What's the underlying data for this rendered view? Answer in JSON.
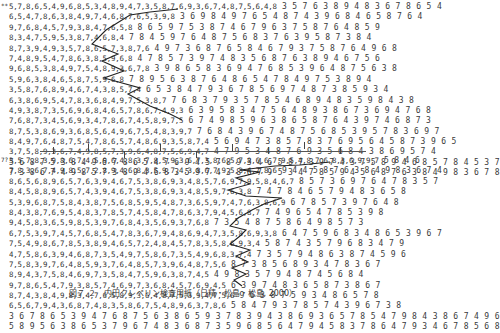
{
  "document": {
    "title": "Uchida-Kraepelin test sheet example",
    "caption": "図７.２　内田クレペリン検査用紙（日精・松島・松島, 2000）"
  },
  "sheet_top": {
    "marker": "**",
    "rows": [
      {
        "done": "5,7,8,6,5,4,9,6,8,5,3,4,8,9,4,7,3,5,8,7,6,9,3,6,7,4,8,7,5,6,4,8",
        "rest": "3 5 7 6 3 8 9 4 8 3 6 7 8 6 5 4"
      },
      {
        "done": "6,5,4,7,8,6,3,8,4,9,7,4,6,8,7,6,5,3,9,8",
        "rest": "3 6 9 8 4 9 7 6 5 4 8 7 4 3 9 6 8 4 6 5 8 7 6 4"
      },
      {
        "done": "9,7,6,8,4,5,7,9,3,8,4,7,6,5,8",
        "rest": "8 6 5 9 7 5 3 8 7 4 6 7 9 6 3 7 5 8 7 6 4 8 5 9"
      },
      {
        "done": "8,3,4,7,5,9,5,3,8,7,4,6,8,4",
        "rest": "7 8 4 5 9 7 6 4 8 7 5 6 8 3 7 6 3 9 5 8 7 3 8 4"
      },
      {
        "done": "8,7,3,9,4,9,3,5,7,8,6,5,7,3,8,7,6",
        "rest": "4 9 7 3 6 8 7 6 5 8 4 6 7 9 3 7 5 8 7 6 4 9 6 8"
      },
      {
        "done": "7,4,8,9,5,4,7,8,6,3,8,5,9,6,8",
        "rest": "4 7 8 5 7 3 9 7 4 8 3 5 6 8 7 6 3 8 9 4 6 7 5 6"
      },
      {
        "done": "9,6,8,5,3,8,4,9,7,5,4,8,9,3,6,7,8",
        "rest": "3 9 8 6 5 8 3 6 9 4 7 6 8 5 3 9 6 4 8 7 5 6 3 8"
      },
      {
        "done": "5,9,6,3,8,4,6,5,8,7,5,9,6,8",
        "rest": "7 8 9 5 6 3 8 7 6 4 8 6 5 4 7 8 4 9 7 5 3 8 9 4"
      },
      {
        "done": "3,5,8,7,6,8,9,4,6,7,4,3,8,5,7,4",
        "rest": "6 5 3 8 4 7 9 3 6 7 8 5 6 9 7 4 8 7 3 8 5 9 3 4"
      },
      {
        "done": "6,3,8,6,9,5,4,7,8,3,6,8,4,9,7,5,3,8,7",
        "rest": "7 6 8 3 7 9 3 5 7 8 5 4 6 8 9 4 8 3 5 9 8 4 3 8"
      },
      {
        "done": "4,9,3,8,7,3,5,6,9,6,8,4,6,5,7,8,6,7,4,9,3",
        "rest": "6 3 9 5 8 3 4 7 5 6 4 8 9 3 8 6 7 3 6 9 4 7 6 8"
      },
      {
        "done": "7,6,8,7,3,4,5,6,9,3,4,7,8,6,7,4,5,8,9,7,5",
        "rest": "6 7 4 9 8 5 9 6 3 8 6 5 8 7 6 4 3 9 7 4 6 8 7 3"
      },
      {
        "done": "8,7,5,3,8,6,9,3,6,8,5,6,4,9,6,7,5,4,8,3,9,7",
        "rest": "7 6 8 4 3 9 6 7 4 8 7 5 6 8 5 3 9 5 7 8 3 6 9 7"
      },
      {
        "done": "8,4,9,7,6,4,8,7,5,4,7,8,6,5,7,4,8,6,9,3,5,8,7,4",
        "rest": "5 6 9 4 7 3 8 5 7 8 3 7 6 9 5 6 4 5 8 7 3 9 6 5"
      },
      {
        "done": "3,7,5,8,9,3,6,7,4,9,8,5,7,3,9,6,4,8,7,5,6,9,4,7",
        "rest": "4 7 9 5 3 4 8 7 6 9 3 5 6 8 4 3 8 6 9 5 7 4"
      },
      {
        "done": "",
        "rest": "5 6 8 7 5 3 8 4 9 6 7 8 6 5 4 7 6 9 4 5 7 8 9 3 4 6 5 8 7 3 9 7 4 3 7 5 8 9 4 6 8 5 7 8 4 5 3 7"
      },
      {
        "done": "",
        "rest": "7 3 8 6 7 4 9 8 5 7 3 8 9 4 6 8 3 5 9 7 4 3 8 6 7 9 5 3 4 7 8 5 9 4 5 6 8 7 6 3 8 4 9 8 3 6 7 8"
      }
    ]
  },
  "ruler": {
    "ticks": [
      {
        "x": 114,
        "dir": "down"
      },
      {
        "x": 222,
        "dir": "up"
      },
      {
        "x": 331,
        "dir": "down"
      },
      {
        "x": 440,
        "dir": "up"
      },
      {
        "x": 548,
        "dir": "down"
      },
      {
        "x": 656,
        "dir": "up"
      },
      {
        "x": 764,
        "dir": "up"
      },
      {
        "x": 872,
        "dir": "down"
      }
    ]
  },
  "sheet_bottom": {
    "marker": "7?",
    "rows": [
      {
        "done": "3,5,7,8,3,9,8,6,7,4,5,9,6,4,8,3,7,8,5,9,3,6,7,3,8,6,5,7,8,6,6,7,9,5,4,8,7,6,8,3,6,9,9,7",
        "rest": "5 8 4 6"
      },
      {
        "done": "7,8,3,6,7,4,9,8,5,7,2,8,9,4,6,8,3,5,9,7,4,3,8,6,7,9,5,3,4,7,8,6",
        "rest": "9 4 4 5 8 7 6 3 8 4 9 8 3 6 7 4"
      },
      {
        "done": "8,6,5,6,8,9,6,5,7,6,3,9,4,6,7,5,3,8,6,9,3,4,8,5,7,6,9,7,9,5,8,4,6,7",
        "rest": "8 5 7 3 6 9 7 6 4 7 8 3 5 7"
      },
      {
        "done": "8,4,5,8,8,9,6,5,7,4,3,9,4,6,7,5,3,8,6,9,3,4,8,5,9,7,6,3,8",
        "rest": "7 4 7 8 4 6 5 7 9 4 8 3 6 5 8"
      },
      {
        "done": "5,3,9,6,8,7,5,8,4,3,8,7,5,6,8,5,9,5,4,8,7,3,6,5,9,7,4,7,6,3,8,6,9",
        "rest": "6 7 8 5 7 3 9 7 6 4 8"
      },
      {
        "done": "8,4,3,8,7,6,9,5,4,8,3,7,8,5,7,4,5,8,4,7,8,6,3,7,9,4,5,6,8,7",
        "rest": "7 4 9 6 5 4 7 8 5 3 9 8"
      },
      {
        "done": "9,4,5,8,3,6,5,9,8,5,3,9,7,6,8,4,3,5,6,9,3,7,6,8",
        "rest": "7 3 5 4 8 7 5 8 6 4 9 8 5 7 3"
      },
      {
        "done": "6,7,5,3,9,7,4,5,7,6,8,5,4,7,8,3,6,7,9,4,8,6,9,4,7,3,5,8,6,9,3,8",
        "rest": "6 4 7 5 9 6 8 3 4 8 6 5 3 9 6 7"
      },
      {
        "done": "7,5,4,9,8,6,7,8,5,3,8,9,4,6,5,7,2,4,8,4,5,7,8,3,5,8,6,9,3,4",
        "rest": "5 8 7 4 3 5 7 9 6 8 3 4 7 9"
      },
      {
        "done": "4,7,5,8,6,3,9,4,6,8,7,3,5,4,9,7,5,8,6,7,3,5,4,9,6,8,3,7,4",
        "rest": "7 3 5 7 9 4 8 6 3 8 7 4 5 9 6"
      },
      {
        "done": "7,5,8,3,9,7,6,4,8,5,9,3,7,6,4,8,5,7,3,9,6,4,8,7,5,6",
        "rest": "8 7 3 8 5 6 8 9 3 4 7 8 3 6 7"
      },
      {
        "done": "8,9,4,3,7,5,8,4,6,9,7,3,5,8,4,7,5,9,6,3,8,7,4,5",
        "rest": "4 9 8 3 5 7 9 4 8 7 4 5 6 8 4"
      },
      {
        "done": "9,7,8,6,5,4,7,9,3,8,5,7,4,6,9,7,3,6,8,4,5,7,6,9,4,5",
        "rest": "6 3 9 7 4 8 3 6 5 8 7 3 8 6 7"
      },
      {
        "done": "8,7,4,3,8,4,9,8,3,4,7,6,5,8,9,3,6,4,8,7,5,3,9,4,7,5,6",
        "rest": "9 6 3 8 7 5 9 3 4 8 6 5 7 8"
      },
      {
        "done": "6,5,6,7,9,4,3,6,8,7,4,8,3,5,8,6,7,5,4,8,9,6,3,7,8,6",
        "rest": "5 8 4 7 9 3 7 8 5 7 4 3 9 6 7 3 8"
      },
      {
        "done": "",
        "rest": "3 6 7 8 6 5 3 9 4 7 6 8 7 5 6 3 8 6 5 9 3 7 8 3 9 4 3 8 6 9 3 6 5 7 8 5 4 7 9 8 4 3 8 6 7 4 9 6"
      },
      {
        "done": "",
        "rest": "5 8 9 5 6 3 8 6 5 3 7 9 6 7 4 8 3 6 8 7 3 5 9 6 8 5 6 4 7 9 4 5 8 3 7 8 6 4 7 9 3 4 6 7 8 5 6 8"
      }
    ]
  },
  "annotation": {
    "zigzag_color": "#222222"
  }
}
